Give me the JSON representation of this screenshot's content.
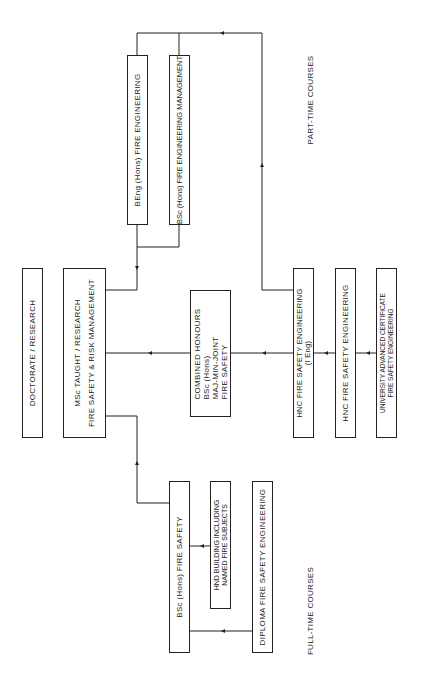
{
  "diagram": {
    "section_labels": {
      "part_time": "PART-TIME COURSES",
      "full_time": "FULL-TIME COURSES"
    },
    "boxes": {
      "doctorate": {
        "lines": [
          "DOCTORATE / RESEARCH"
        ]
      },
      "msc": {
        "lines": [
          "MSc TAUGHT / RESEARCH",
          "",
          "FIRE SAFETY & RISK MANAGEMENT"
        ]
      },
      "beng": {
        "lines": [
          "BEng (Hons) FIRE ENGINEERING"
        ]
      },
      "bsc_fem": {
        "lines": [
          "BSc (Hons) FIRE ENGINEERING MANAGEMENT"
        ]
      },
      "combined": {
        "lines": [
          "COMBINED HONOURS",
          "BSc (Hons)",
          "MAJ-MIN-JOINT",
          "FIRE SAFETY"
        ]
      },
      "hnc_ieng": {
        "lines": [
          "HNC FIRE SAFETY ENGINEERING",
          "(I Eng)"
        ]
      },
      "hnc": {
        "lines": [
          "HNC FIRE SAFETY ENGINEERING"
        ]
      },
      "univ_cert": {
        "lines": [
          "UNIVERSITY ADVANCED CERTIFICATE",
          "FIRE SAFETY ENGINEERING"
        ]
      },
      "bsc_fs": {
        "lines": [
          "BSc (Hons) FIRE SAFETY"
        ]
      },
      "hnd": {
        "lines": [
          "HND BUILDING INCLUDING",
          "NAMED FIRE SUBJECTS"
        ]
      },
      "diploma": {
        "lines": [
          "DIPLOMA FIRE SAFETY ENGINEERING"
        ]
      }
    },
    "line_color": "#222222"
  }
}
